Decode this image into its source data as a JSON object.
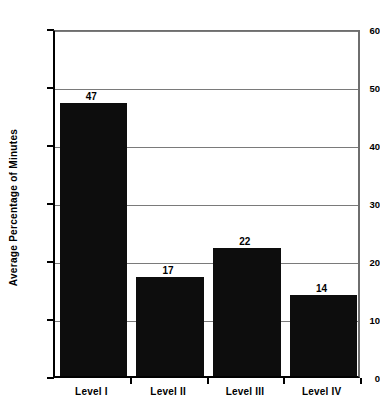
{
  "chart_data": {
    "type": "bar",
    "title": "",
    "subtitle": "",
    "categories": [
      "Level I",
      "Level II",
      "Level III",
      "Level IV"
    ],
    "values": [
      47,
      17,
      22,
      14
    ],
    "data_labels": [
      "47",
      "17",
      "22",
      "14"
    ],
    "xlabel": "",
    "ylabel": "Average Percentage of Minutes",
    "ylim": [
      0,
      60
    ],
    "yticks": [
      0,
      10,
      20,
      30,
      40,
      50,
      60
    ],
    "ytick_labels": [
      "0",
      "10",
      "20",
      "30",
      "40",
      "50",
      "60"
    ],
    "grid": "horizontal",
    "legend": "none",
    "bar_color": "#0d0d0d",
    "grid_color": "#7a7a7a",
    "axis_color": "#000000",
    "background_color": "#ffffff"
  },
  "axes": {
    "y_title": "Average Percentage of Minutes"
  }
}
